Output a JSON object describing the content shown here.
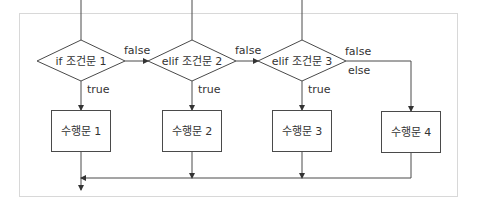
{
  "diagram": {
    "colors": {
      "line": "#4a4a4a",
      "frame": "#d8d8d8",
      "text": "#333333",
      "background": "#ffffff"
    },
    "conditions": [
      {
        "id": "cond1",
        "label": "if 조건문 1"
      },
      {
        "id": "cond2",
        "label": "elif 조건문 2"
      },
      {
        "id": "cond3",
        "label": "elif 조건문 3"
      }
    ],
    "statements": [
      {
        "id": "stmt1",
        "label": "수행문 1"
      },
      {
        "id": "stmt2",
        "label": "수행문 2"
      },
      {
        "id": "stmt3",
        "label": "수행문 3"
      },
      {
        "id": "stmt4",
        "label": "수행문 4"
      }
    ],
    "edge_labels": {
      "false1": "false",
      "false2": "false",
      "false3": "false",
      "else": "else",
      "true1": "true",
      "true2": "true",
      "true3": "true"
    }
  }
}
